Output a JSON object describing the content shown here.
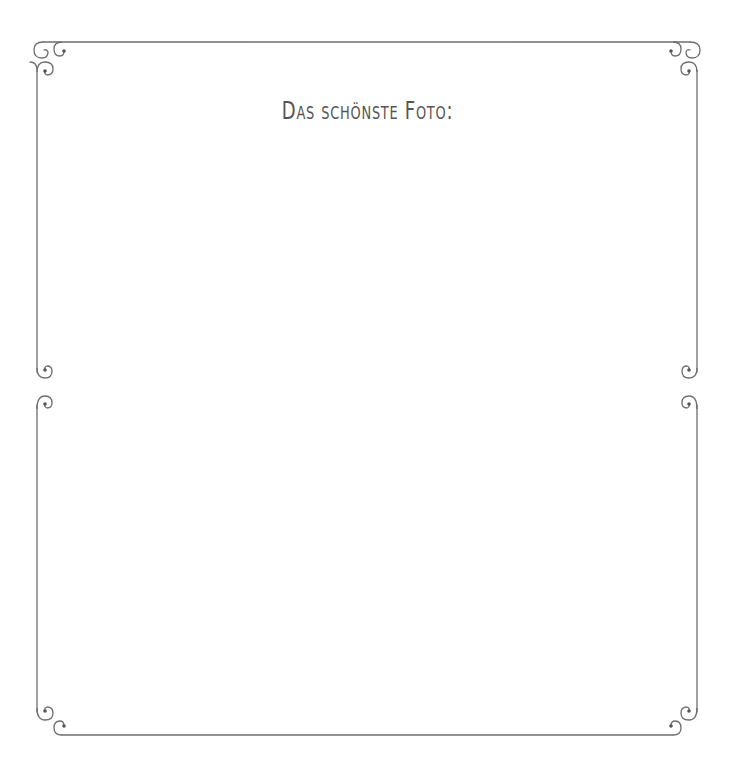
{
  "page": {
    "title": "Das schönste Foto:"
  },
  "colors": {
    "frame_line": "#6e6e6e",
    "title_text": "#555555",
    "background": "#ffffff"
  },
  "panels": [
    {
      "name": "top-photo-area",
      "content": ""
    },
    {
      "name": "bottom-photo-area",
      "content": ""
    }
  ]
}
